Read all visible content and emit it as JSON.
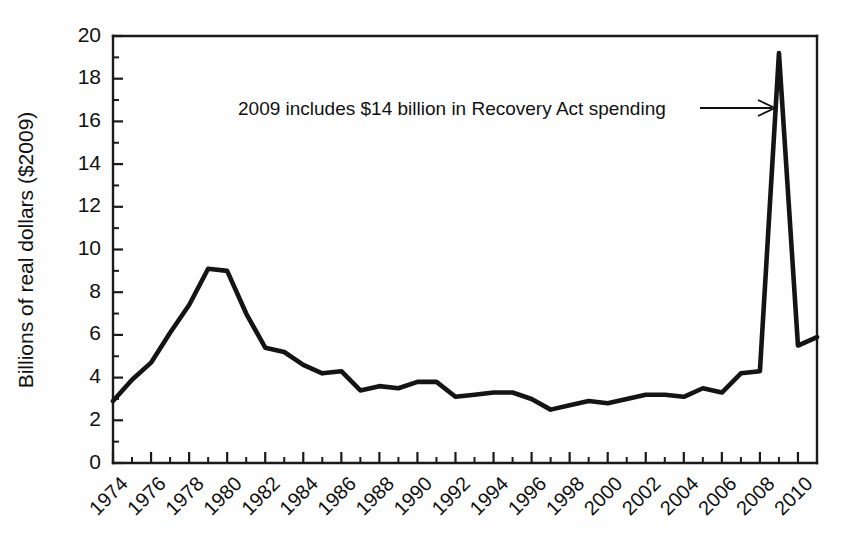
{
  "chart_data": {
    "type": "line",
    "title": "",
    "xlabel": "",
    "ylabel": "Billions of real dollars ($2009)",
    "xlim": [
      1974,
      2011
    ],
    "ylim": [
      0,
      20
    ],
    "grid": false,
    "legend": "none",
    "y_ticks": [
      0,
      2,
      4,
      6,
      8,
      10,
      12,
      14,
      16,
      18,
      20
    ],
    "y_tick_labels": [
      "0",
      "2",
      "4",
      "6",
      "8",
      "10",
      "12",
      "14",
      "16",
      "18",
      "20"
    ],
    "y_minor_tick_step": 1,
    "x_ticks": [
      1974,
      1976,
      1978,
      1980,
      1982,
      1984,
      1986,
      1988,
      1990,
      1992,
      1994,
      1996,
      1998,
      2000,
      2002,
      2004,
      2006,
      2008,
      2010
    ],
    "x_tick_labels": [
      "1974",
      "1976",
      "1978",
      "1980",
      "1982",
      "1984",
      "1986",
      "1988",
      "1990",
      "1992",
      "1994",
      "1996",
      "1998",
      "2000",
      "2002",
      "2004",
      "2006",
      "2008",
      "2010"
    ],
    "x_minor_tick_step": 1,
    "x_tick_label_rotation": -45,
    "series": [
      {
        "name": "Real spending",
        "color": "#141414",
        "x": [
          1974,
          1975,
          1976,
          1977,
          1978,
          1979,
          1980,
          1981,
          1982,
          1983,
          1984,
          1985,
          1986,
          1987,
          1988,
          1989,
          1990,
          1991,
          1992,
          1993,
          1994,
          1995,
          1996,
          1997,
          1998,
          1999,
          2000,
          2001,
          2002,
          2003,
          2004,
          2005,
          2006,
          2007,
          2008,
          2009,
          2010,
          2011
        ],
        "values": [
          2.9,
          3.9,
          4.7,
          6.1,
          7.4,
          9.1,
          9.0,
          7.0,
          5.4,
          5.2,
          4.6,
          4.2,
          4.3,
          3.4,
          3.6,
          3.5,
          3.8,
          3.8,
          3.1,
          3.2,
          3.3,
          3.3,
          3.0,
          2.5,
          2.7,
          2.9,
          2.8,
          3.0,
          3.2,
          3.2,
          3.1,
          3.5,
          3.3,
          4.2,
          4.3,
          19.2,
          5.5,
          5.9
        ]
      }
    ],
    "annotations": [
      {
        "text": "2009 includes $14 billion in Recovery Act spending",
        "points_to_year": 2009,
        "points_to_value": 16.6,
        "arrow": "right"
      }
    ]
  },
  "figure": {
    "background_color": "#fefefe",
    "line_color": "#141414",
    "axis_color": "#1a1a1a"
  }
}
